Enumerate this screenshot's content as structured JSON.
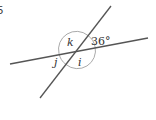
{
  "question": {
    "number": "5"
  },
  "diagram": {
    "angles": [
      {
        "id": "k",
        "label": "k"
      },
      {
        "id": "36",
        "label": "36°"
      },
      {
        "id": "j",
        "label": "j"
      },
      {
        "id": "i",
        "label": "i"
      }
    ],
    "colors": {
      "line": "#555555",
      "arc": "#aaaaaa",
      "text": "#333333"
    }
  }
}
